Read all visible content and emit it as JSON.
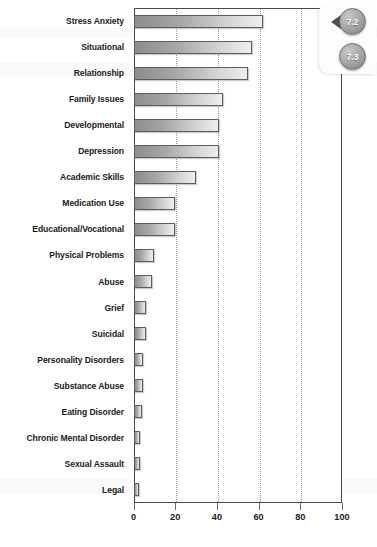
{
  "chart_data": {
    "type": "bar",
    "orientation": "horizontal",
    "title": "",
    "xlabel": "",
    "ylabel": "",
    "xlim": [
      0,
      100
    ],
    "xticks": [
      0,
      20,
      40,
      60,
      80,
      100
    ],
    "grid": true,
    "legend": false,
    "categories": [
      "Stress Anxiety",
      "Situational",
      "Relationship",
      "Family Issues",
      "Developmental",
      "Depression",
      "Academic Skills",
      "Medication Use",
      "Educational/Vocational",
      "Physical Problems",
      "Abuse",
      "Grief",
      "Suicidal",
      "Personality Disorders",
      "Substance Abuse",
      "Eating Disorder",
      "Chronic Mental Disorder",
      "Sexual Assault",
      "Legal"
    ],
    "values": [
      62,
      57,
      55,
      43,
      41,
      41,
      30,
      20,
      20,
      10,
      9,
      6,
      6,
      4.5,
      4.5,
      4,
      3,
      3,
      2.5
    ],
    "bar_gradient": {
      "from": "#8d8d8d",
      "to": "#eeeeee",
      "border": "#5d5d5d"
    },
    "axis_color": "#4a4a4a",
    "gridline_color": "#9a9a9a"
  },
  "badges": {
    "first": "7.2",
    "second": "7.3"
  }
}
